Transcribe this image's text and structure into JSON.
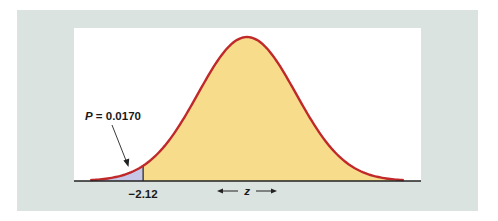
{
  "chart_data": {
    "type": "area",
    "title": "",
    "xlabel": "z",
    "ylabel": "",
    "distribution": {
      "name": "standard normal",
      "mean": 0,
      "sd": 1
    },
    "x_range": [
      -3.2,
      3.2
    ],
    "critical_value": -2.12,
    "critical_value_label": "−2.12",
    "shaded_tail": {
      "side": "left",
      "from": "-inf",
      "to": -2.12,
      "probability": 0.017
    },
    "annotation": {
      "text_prefix": "P",
      "text_suffix": " = 0.0170",
      "points_to": "left tail area"
    },
    "axis_label": "z",
    "axis_arrows": [
      "left",
      "right"
    ],
    "grid": false,
    "legend": null,
    "colors": {
      "panel_background": "#dbe3e0",
      "plot_background": "#ffffff",
      "curve": "#c0282a",
      "body_fill": "#f7dc8c",
      "tail_fill": "#c6c6e6",
      "axis": "#222222"
    }
  }
}
